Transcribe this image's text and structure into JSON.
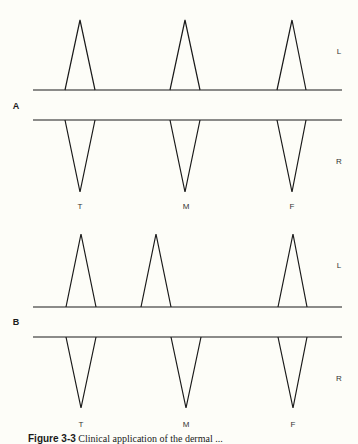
{
  "panels": [
    {
      "label": "A",
      "side_labels": {
        "top": "L",
        "bottom": "R"
      },
      "top_peaks": [
        "T",
        "M",
        "F"
      ],
      "bottom_peaks": [
        "T",
        "M",
        "F"
      ],
      "peak_labels": [
        "T",
        "M",
        "F"
      ]
    },
    {
      "label": "B",
      "side_labels": {
        "top": "L",
        "bottom": "R"
      },
      "top_peaks": [
        "T",
        "between T and M",
        "F"
      ],
      "bottom_peaks": [
        "T",
        "M",
        "F"
      ],
      "peak_labels": [
        "T",
        "M",
        "F"
      ]
    }
  ],
  "caption": {
    "figure": "Figure 3-3",
    "text": "Clinical application of the dermal ..."
  },
  "colors": {
    "background": "#fdfdf8",
    "stroke": "#1a1a1a"
  }
}
